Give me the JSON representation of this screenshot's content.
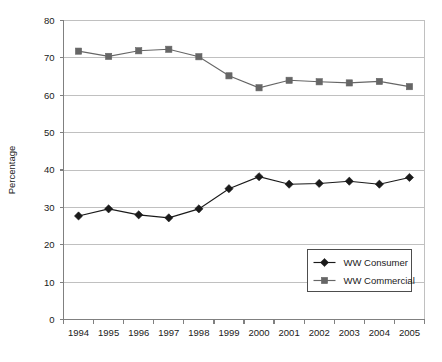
{
  "chart_data": {
    "type": "line",
    "title": "",
    "xlabel": "",
    "ylabel": "Percentage",
    "categories": [
      "1994",
      "1995",
      "1996",
      "1997",
      "1998",
      "1999",
      "2000",
      "2001",
      "2002",
      "2003",
      "2004",
      "2005"
    ],
    "series": [
      {
        "name": "WW Consumer",
        "marker": "diamond",
        "color": "#1a1a1a",
        "values": [
          27.7,
          29.6,
          28.0,
          27.2,
          29.6,
          35.0,
          38.2,
          36.2,
          36.4,
          37.0,
          36.2,
          38.0
        ]
      },
      {
        "name": "WW Commercial",
        "marker": "square",
        "color": "#666666",
        "values": [
          71.8,
          70.4,
          71.9,
          72.3,
          70.3,
          65.2,
          62.0,
          64.0,
          63.6,
          63.3,
          63.7,
          62.3
        ]
      }
    ],
    "ylim": [
      0,
      80
    ],
    "yticks": [
      0,
      10,
      20,
      30,
      40,
      50,
      60,
      70,
      80
    ],
    "ytick_labels": [
      "0",
      "10",
      "20",
      "30",
      "40",
      "50",
      "60",
      "70",
      "80"
    ],
    "grid": true,
    "grid_axis": "y",
    "legend_position": "lower-right",
    "axis_color": "#808080",
    "grid_color": "#c0c0c0",
    "background": "#ffffff"
  },
  "legend": {
    "entries": [
      {
        "label": "WW Consumer"
      },
      {
        "label": "WW Commercial"
      }
    ]
  }
}
